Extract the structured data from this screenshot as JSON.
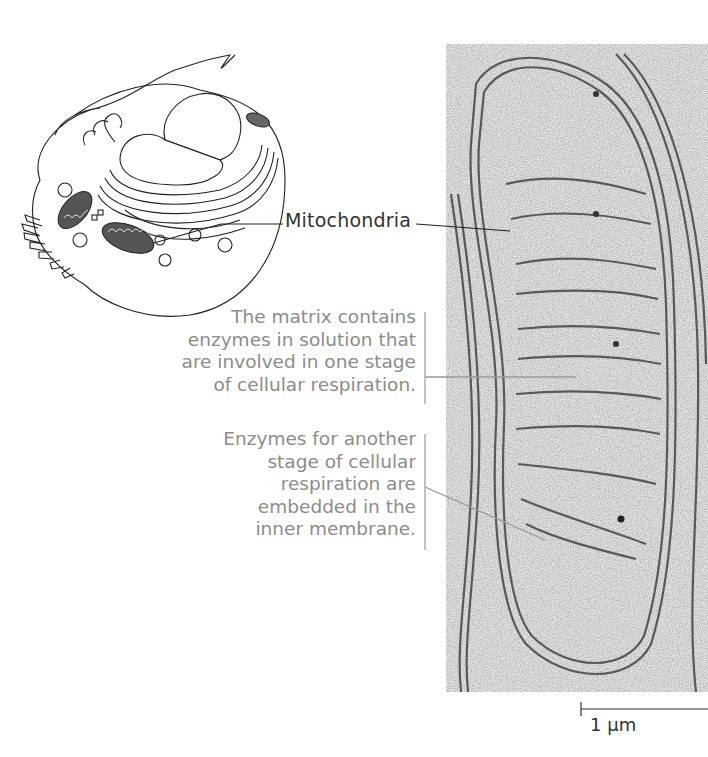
{
  "figure": {
    "cell_diagram": {
      "description": "Animal cell illustration with mitochondria highlighted"
    },
    "micrograph": {
      "description": "Electron micrograph of mitochondrion"
    },
    "labels": {
      "mitochondria": "Mitochondria",
      "matrix_callout": [
        "The matrix contains",
        "enzymes in solution that",
        "are involved in one stage",
        "of cellular respiration."
      ],
      "membrane_callout": [
        "Enzymes for another",
        "stage of cellular",
        "respiration are",
        "embedded in the",
        "inner membrane."
      ]
    },
    "scale_bar": {
      "label": "1 µm"
    },
    "colors": {
      "label_dark": "#333333",
      "label_gray": "#8c8c8c",
      "leader_gray": "#9a9a9a"
    }
  }
}
